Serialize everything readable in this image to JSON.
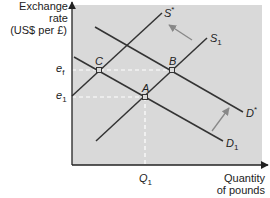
{
  "diagram": {
    "y_axis_label_line1": "Exchange rate",
    "y_axis_label_line2": "(US$ per £)",
    "x_axis_label_line1": "Quantity",
    "x_axis_label_line2": "of pounds",
    "y_ticks": [
      {
        "base": "e",
        "sub": "f"
      },
      {
        "base": "e",
        "sub": "1"
      }
    ],
    "x_ticks": [
      {
        "base": "Q",
        "sub": "1"
      }
    ],
    "points": [
      "A",
      "B",
      "C"
    ],
    "curves": {
      "s_star": {
        "base": "S",
        "sup": "*"
      },
      "s1": {
        "base": "S",
        "sub": "1"
      },
      "d_star": {
        "base": "D",
        "sup": "*"
      },
      "d1": {
        "base": "D",
        "sub": "1"
      }
    },
    "colors": {
      "plot_background": "#d9d9d9",
      "lines": "#333333",
      "dashed_guides": "#ffffff",
      "shift_arrows": "#888888"
    }
  }
}
